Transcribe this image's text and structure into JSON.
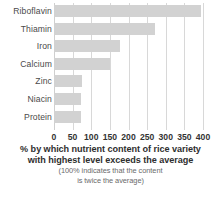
{
  "chart_data": {
    "type": "bar",
    "orientation": "horizontal",
    "title": "",
    "categories": [
      "Riboflavin",
      "Thiamin",
      "Iron",
      "Calcium",
      "Zinc",
      "Niacin",
      "Protein"
    ],
    "values": [
      395,
      270,
      178,
      150,
      75,
      72,
      72
    ],
    "xlabel": "% by which nutrient content of rice variety with highest level exceeds the average",
    "ylabel": "",
    "xlim": [
      0,
      400
    ],
    "xticks": [
      0,
      50,
      100,
      150,
      200,
      250,
      300,
      350,
      400
    ],
    "xtick_labels": [
      "0",
      "50",
      "100",
      "150",
      "200",
      "250",
      "300",
      "350",
      "400"
    ],
    "grid": "vertical",
    "legend": "none",
    "bar_color": "#d2d2d2",
    "gridline_color": "#d8d8d8",
    "text_color": "#3a3a3a"
  },
  "caption": {
    "line1": "% by which nutrient content of rice variety",
    "line2": "with highest level exceeds the average",
    "note1": "(100% indicates that the content",
    "note2": "is twice the average)"
  }
}
